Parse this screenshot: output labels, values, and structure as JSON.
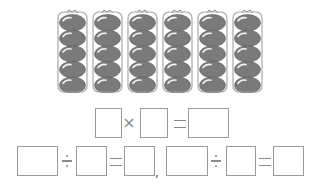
{
  "picture": {
    "description": "6 bags of tomatoes, 5 tomatoes per bag",
    "bag_count": 6,
    "tomatoes_per_bag": 5,
    "bag_x": [
      57,
      92,
      127,
      162,
      197,
      232
    ],
    "colors": {
      "tomato": "#7a7a7a",
      "highlight": "#f2f2f2",
      "bag_outline": "#a8a8a8"
    }
  },
  "equations": {
    "row1": {
      "operator1": "×",
      "operator2": "=",
      "blanks": [
        "",
        "",
        ""
      ]
    },
    "row2_left": {
      "operator1": "÷",
      "operator2": "=",
      "blanks": [
        "",
        "",
        ""
      ]
    },
    "separator": ",",
    "row2_right": {
      "operator1": "÷",
      "operator2": "=",
      "blanks": [
        "",
        "",
        ""
      ]
    }
  }
}
